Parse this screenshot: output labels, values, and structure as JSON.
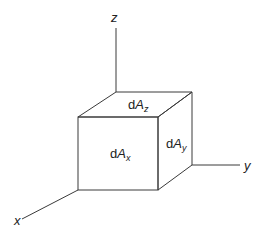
{
  "diagram": {
    "type": "3d-coordinate-cube",
    "axes": {
      "x": {
        "label": "x"
      },
      "y": {
        "label": "y"
      },
      "z": {
        "label": "z"
      }
    },
    "faces": {
      "top": {
        "prefix": "d",
        "var": "A",
        "sub": "z"
      },
      "front": {
        "prefix": "d",
        "var": "A",
        "sub": "x"
      },
      "side": {
        "prefix": "d",
        "var": "A",
        "sub": "y"
      }
    },
    "colors": {
      "line": "#3a3a3a",
      "text": "#222222",
      "background": "#ffffff"
    }
  }
}
